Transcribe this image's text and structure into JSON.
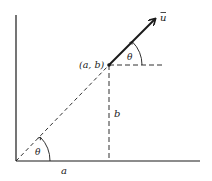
{
  "diagram": {
    "title": "",
    "labels": {
      "vector": "u",
      "point": "(a, b)",
      "angle_top": "θ",
      "angle_bottom": "θ",
      "vertical_segment": "b",
      "horizontal_segment": "a"
    },
    "colors": {
      "ink": "#1a1a1a",
      "background": "#ffffff"
    },
    "geometry": {
      "origin": [
        16,
        161
      ],
      "point_ab": [
        109,
        65
      ],
      "vector_tip": [
        156,
        18
      ]
    }
  }
}
